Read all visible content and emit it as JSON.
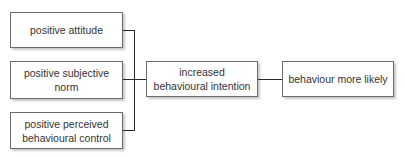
{
  "diagram": {
    "type": "flow",
    "inputs": [
      {
        "label": "positive attitude"
      },
      {
        "label": "positive subjective norm"
      },
      {
        "label": "positive perceived behavioural control"
      }
    ],
    "intermediate": {
      "label": "increased behavioural intention"
    },
    "outcome": {
      "label": "behaviour more likely"
    },
    "edges": [
      {
        "from": "positive attitude",
        "to": "increased behavioural intention"
      },
      {
        "from": "positive subjective norm",
        "to": "increased behavioural intention"
      },
      {
        "from": "positive perceived behavioural control",
        "to": "increased behavioural intention"
      },
      {
        "from": "increased behavioural intention",
        "to": "behaviour more likely"
      }
    ],
    "colors": {
      "border": "#6b6b6b",
      "line": "#2a2a2a",
      "text": "#333333",
      "shadow": "#c8c8c8"
    }
  }
}
